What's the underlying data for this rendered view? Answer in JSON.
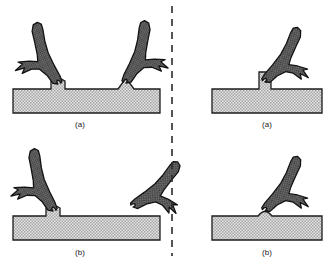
{
  "figure": {
    "width": 335,
    "height": 262,
    "background": "#ffffff",
    "divider": {
      "name": "vertical-dashed-divider",
      "x": 172,
      "y1": 6,
      "y2": 256,
      "dash": "7,6",
      "color": "#2b2b2b",
      "width": 1.6
    },
    "colors": {
      "tool_fill": "#6e6e6e",
      "tool_stipple_dark": "#3a3a3a",
      "tool_outline": "#121212",
      "substrate_fill": "#d2d2d2",
      "substrate_stipple": "#9a9a9a",
      "substrate_outline": "#1c1c1c",
      "caption": "#1a1a1a"
    }
  },
  "panels": [
    {
      "id": "left-a",
      "caption": "(a)",
      "caption_x": 80,
      "caption_y": 124,
      "side": "left",
      "description": "Two Y-shaped tools engaged with substrate: left tool on rounded stub, right tool on pointed peak",
      "substrate": {
        "name": "substrate-bar-left-a",
        "x": 13,
        "y": 89,
        "width": 147,
        "height": 24
      },
      "features": [
        {
          "type": "rounded-stub",
          "cx": 58,
          "top": 80
        },
        {
          "type": "pointed-peak",
          "cx": 126,
          "top": 78
        }
      ],
      "tools": [
        {
          "name": "tool-left",
          "mirrored": false,
          "angle": -22,
          "anchor_x": 58,
          "anchor_y": 82
        },
        {
          "name": "tool-right",
          "mirrored": true,
          "angle": 20,
          "anchor_x": 126,
          "anchor_y": 82
        }
      ]
    },
    {
      "id": "left-b",
      "caption": "(b)",
      "caption_x": 80,
      "caption_y": 252,
      "side": "left",
      "description": "One Y-shaped tool engaged on rounded stub; second tool detached and rotated away from substrate",
      "substrate": {
        "name": "substrate-bar-left-b",
        "x": 13,
        "y": 216,
        "width": 147,
        "height": 24
      },
      "features": [
        {
          "type": "rounded-stub",
          "cx": 53,
          "top": 207
        }
      ],
      "tools": [
        {
          "name": "tool-attached",
          "mirrored": false,
          "angle": -20,
          "anchor_x": 53,
          "anchor_y": 209
        },
        {
          "name": "tool-detached",
          "mirrored": true,
          "angle": 48,
          "anchor_x": 126,
          "anchor_y": 212
        }
      ]
    },
    {
      "id": "right-a",
      "caption": "(a)",
      "caption_x": 267,
      "caption_y": 124,
      "side": "right",
      "description": "Single Y-shaped tool gripping a tall vertical post on the substrate",
      "substrate": {
        "name": "substrate-bar-right-a",
        "x": 212,
        "y": 89,
        "width": 110,
        "height": 24
      },
      "features": [
        {
          "type": "vertical-post",
          "cx": 265,
          "top": 72
        }
      ],
      "tools": [
        {
          "name": "tool-gripping-post",
          "mirrored": true,
          "angle": 34,
          "anchor_x": 265,
          "anchor_y": 80
        }
      ]
    },
    {
      "id": "right-b",
      "caption": "(b)",
      "caption_x": 267,
      "caption_y": 252,
      "side": "right",
      "description": "Single Y-shaped tool over a low rounded dome on the substrate",
      "substrate": {
        "name": "substrate-bar-right-b",
        "x": 212,
        "y": 216,
        "width": 110,
        "height": 24
      },
      "features": [
        {
          "type": "rounded-dome",
          "cx": 265,
          "top": 209
        }
      ],
      "tools": [
        {
          "name": "tool-over-dome",
          "mirrored": true,
          "angle": 34,
          "anchor_x": 265,
          "anchor_y": 211
        }
      ]
    }
  ]
}
